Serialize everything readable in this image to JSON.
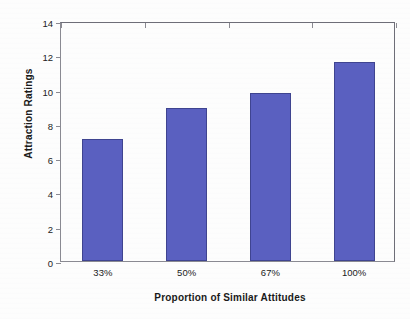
{
  "chart_data": {
    "type": "bar",
    "title": "",
    "xlabel": "Proportion of Similar Attitudes",
    "ylabel": "Attraction Ratings",
    "categories": [
      "33%",
      "50%",
      "67%",
      "100%"
    ],
    "values": [
      7.1,
      8.9,
      9.8,
      11.6
    ],
    "ylim": [
      0,
      14
    ],
    "ytick_labels": [
      "0",
      "2",
      "4",
      "6",
      "8",
      "10",
      "12",
      "14"
    ],
    "ytick_values": [
      0,
      2,
      4,
      6,
      8,
      10,
      12,
      14
    ],
    "grid": false,
    "legend": "none",
    "series": [
      {
        "name": "Attraction Ratings",
        "values": [
          7.1,
          8.9,
          9.8,
          11.6
        ],
        "color": "#5a60c0"
      }
    ],
    "bar_color": "#5a60c0",
    "bar_edge_color": "#3f4490",
    "axis_color": "#8a8a92",
    "background_color": "#fdfdfd"
  }
}
